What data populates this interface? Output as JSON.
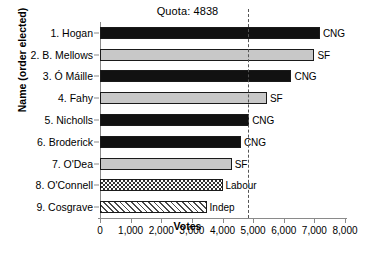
{
  "chart_data": {
    "type": "bar",
    "orientation": "horizontal",
    "title": "Quota: 4838",
    "xlabel": "Votes",
    "ylabel": "Name (order elected)",
    "xlim": [
      0,
      8000
    ],
    "xticks": [
      0,
      1000,
      2000,
      3000,
      4000,
      5000,
      6000,
      7000,
      8000
    ],
    "xticklabels": [
      "0",
      "1,000",
      "2,000",
      "3,000",
      "4,000",
      "5,000",
      "6,000",
      "7,000",
      "8,000"
    ],
    "grid": false,
    "legend": "none",
    "annotations": [
      {
        "name": "quota-line",
        "type": "vline",
        "value": 4838,
        "style": "dashed",
        "label": "Quota: 4838"
      }
    ],
    "categories": [
      "1. Hogan",
      "2. B. Mellows",
      "3. Ó Máille",
      "4. Fahy",
      "5. Nicholls",
      "6. Broderick",
      "7. O'Dea",
      "8. O'Connell",
      "9. Cosgrave"
    ],
    "values": [
      7180,
      7000,
      6250,
      5450,
      4870,
      4600,
      4300,
      4000,
      3480
    ],
    "bar_labels": [
      "CNG",
      "SF",
      "CNG",
      "SF",
      "CNG",
      "CNG",
      "SF",
      "Labour",
      "Indep"
    ],
    "bar_styles": [
      "cng",
      "sf",
      "cng",
      "sf",
      "cng",
      "cng",
      "sf",
      "labour",
      "indep"
    ],
    "colors": {
      "cng": "#111111",
      "sf": "#c8c8c8",
      "labour": "#333333",
      "indep": "#4a4a4a",
      "axis": "#8a8a8a",
      "quota": "#555555"
    }
  }
}
